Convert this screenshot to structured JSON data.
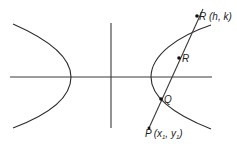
{
  "diagram": {
    "type": "hyperbola-with-secant-line",
    "labels": {
      "point_top": "R (h, k)",
      "point_mid": "R",
      "point_q": "Q",
      "point_p_main": "P",
      "point_p_open": "(x",
      "point_p_sub1": "1",
      "point_p_comma": ", y",
      "point_p_sub2": "1",
      "point_p_close": ")"
    },
    "colors": {
      "stroke": "#2a2a2a",
      "text": "#222222",
      "background": "#ffffff"
    }
  }
}
